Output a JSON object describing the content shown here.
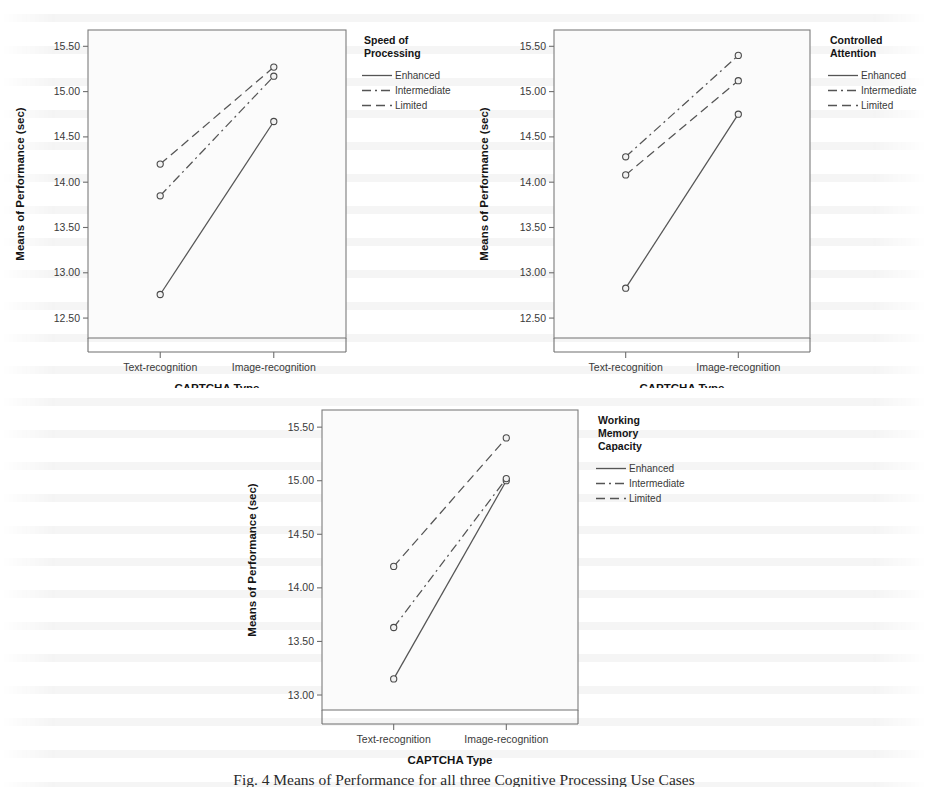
{
  "figure": {
    "caption": "Fig. 4 Means of Performance for all three Cognitive Processing Use Cases"
  },
  "common": {
    "y_axis_title": "Means of Performance (sec)",
    "x_axis_title": "CAPTCHA Type",
    "categories": [
      "Text-recognition",
      "Image-recognition"
    ],
    "series_names": [
      "Enhanced",
      "Intermediate",
      "Limited"
    ],
    "line_styles": [
      "solid",
      "dash-dot",
      "dashed"
    ],
    "line_color": "#555555",
    "marker_color": "#4a4a4a",
    "plot_background": "#fbfbfb"
  },
  "chart_data": [
    {
      "type": "line",
      "panel": "top-left",
      "title": "",
      "legend_title": "Speed of Processing",
      "legend_title_lines": [
        "Speed of",
        "Processing"
      ],
      "legend_position": "right",
      "xlabel": "CAPTCHA Type",
      "ylabel": "Means of Performance (sec)",
      "categories": [
        "Text-recognition",
        "Image-recognition"
      ],
      "yticks": [
        12.5,
        13.0,
        13.5,
        14.0,
        14.5,
        15.0,
        15.5
      ],
      "ytick_labels": [
        "12.50",
        "13.00",
        "13.50",
        "14.00",
        "14.50",
        "15.00",
        "15.50"
      ],
      "ylim": [
        12.28,
        15.68
      ],
      "grid": false,
      "series": [
        {
          "name": "Enhanced",
          "style": "solid",
          "values": [
            12.76,
            14.67
          ]
        },
        {
          "name": "Intermediate",
          "style": "dash-dot",
          "values": [
            13.85,
            15.17
          ]
        },
        {
          "name": "Limited",
          "style": "dashed",
          "values": [
            14.2,
            15.27
          ]
        }
      ]
    },
    {
      "type": "line",
      "panel": "top-right",
      "title": "",
      "legend_title": "Controlled Attention",
      "legend_title_lines": [
        "Controlled",
        "Attention"
      ],
      "legend_position": "right",
      "xlabel": "CAPTCHA Type",
      "ylabel": "Means of Performance (sec)",
      "categories": [
        "Text-recognition",
        "Image-recognition"
      ],
      "yticks": [
        12.5,
        13.0,
        13.5,
        14.0,
        14.5,
        15.0,
        15.5
      ],
      "ytick_labels": [
        "12.50",
        "13.00",
        "13.50",
        "14.00",
        "14.50",
        "15.00",
        "15.50"
      ],
      "ylim": [
        12.28,
        15.68
      ],
      "grid": false,
      "series": [
        {
          "name": "Enhanced",
          "style": "solid",
          "values": [
            12.83,
            14.75
          ]
        },
        {
          "name": "Intermediate",
          "style": "dash-dot",
          "values": [
            14.28,
            15.4
          ]
        },
        {
          "name": "Limited",
          "style": "dashed",
          "values": [
            14.08,
            15.12
          ]
        }
      ]
    },
    {
      "type": "line",
      "panel": "bottom-center",
      "title": "",
      "legend_title": "Working Memory Capacity",
      "legend_title_lines": [
        "Working",
        "Memory",
        "Capacity"
      ],
      "legend_position": "right",
      "xlabel": "CAPTCHA Type",
      "ylabel": "Means of Performance (sec)",
      "categories": [
        "Text-recognition",
        "Image-recognition"
      ],
      "yticks": [
        13.0,
        13.5,
        14.0,
        14.5,
        15.0,
        15.5
      ],
      "ytick_labels": [
        "13.00",
        "13.50",
        "14.00",
        "14.50",
        "15.00",
        "15.50"
      ],
      "ylim": [
        12.86,
        15.66
      ],
      "grid": false,
      "series": [
        {
          "name": "Enhanced",
          "style": "solid",
          "values": [
            13.15,
            15.0
          ]
        },
        {
          "name": "Intermediate",
          "style": "dash-dot",
          "values": [
            13.63,
            15.02
          ]
        },
        {
          "name": "Limited",
          "style": "dashed",
          "values": [
            14.2,
            15.4
          ]
        }
      ]
    }
  ]
}
